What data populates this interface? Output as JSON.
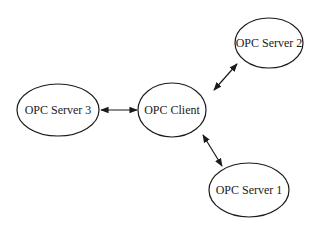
{
  "diagram": {
    "nodes": {
      "client": {
        "label": "OPC Client",
        "cx": 172,
        "cy": 110,
        "rx": 34,
        "ry": 27
      },
      "server1": {
        "label": "OPC Server 1",
        "cx": 249,
        "cy": 190,
        "rx": 40,
        "ry": 27
      },
      "server2": {
        "label": "OPC Server 2",
        "cx": 269,
        "cy": 43,
        "rx": 34,
        "ry": 25
      },
      "server3": {
        "label": "OPC Server 3",
        "cx": 58,
        "cy": 110,
        "rx": 41,
        "ry": 26
      }
    },
    "edges": [
      {
        "from": "client",
        "to": "server1",
        "type": "bidirectional"
      },
      {
        "from": "client",
        "to": "server2",
        "type": "bidirectional"
      },
      {
        "from": "client",
        "to": "server3",
        "type": "bidirectional"
      }
    ]
  }
}
